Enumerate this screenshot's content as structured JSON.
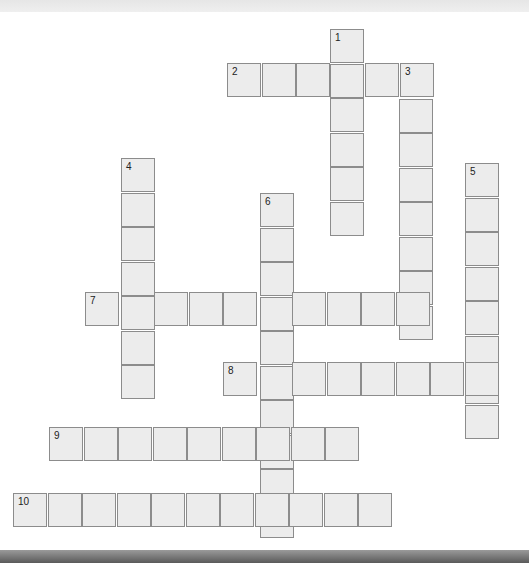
{
  "puzzle": {
    "type": "crossword",
    "cell_size": 34.5,
    "words": [
      {
        "number": "1",
        "direction": "down",
        "length": 6,
        "x": 330,
        "y": 29
      },
      {
        "number": "2",
        "direction": "across",
        "length": 6,
        "x": 227,
        "y": 63
      },
      {
        "number": "3",
        "direction": "down",
        "length": 8,
        "x": 399,
        "y": 64
      },
      {
        "number": "4",
        "direction": "down",
        "length": 7,
        "x": 121,
        "y": 158
      },
      {
        "number": "5",
        "direction": "down",
        "length": 8,
        "x": 465,
        "y": 163
      },
      {
        "number": "6",
        "direction": "down",
        "length": 10,
        "x": 260,
        "y": 193
      },
      {
        "number": "7",
        "direction": "across",
        "length": 10,
        "x": 85,
        "y": 292
      },
      {
        "number": "8",
        "direction": "across",
        "length": 8,
        "x": 223,
        "y": 362
      },
      {
        "number": "9",
        "direction": "across",
        "length": 9,
        "x": 49,
        "y": 427
      },
      {
        "number": "10",
        "direction": "across",
        "length": 11,
        "x": 13,
        "y": 493
      }
    ]
  },
  "colors": {
    "cell_fill": "#ececec",
    "cell_border": "#8c8c8c",
    "background": "#ffffff",
    "number_text": "#222222"
  }
}
